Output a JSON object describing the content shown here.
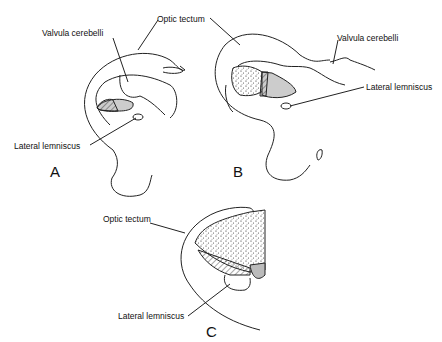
{
  "figure": {
    "panels": [
      {
        "id": "A",
        "labels": {
          "valvula": "Valvula cerebelli",
          "tectum": "Optic tectum",
          "lemniscus": "Lateral lemniscus"
        }
      },
      {
        "id": "B",
        "labels": {
          "valvula": "Valvula cerebelli",
          "lemniscus": "Lateral lemniscus"
        }
      },
      {
        "id": "C",
        "labels": {
          "tectum": "Optic tectum",
          "lemniscus": "Lateral lemniscus"
        }
      }
    ]
  }
}
